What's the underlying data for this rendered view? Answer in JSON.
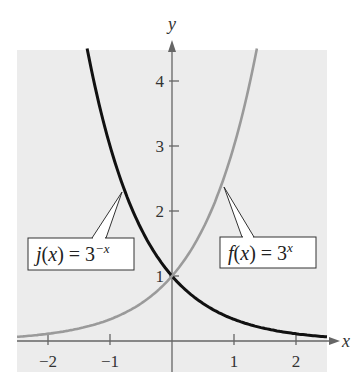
{
  "chart_data": {
    "type": "line",
    "title": "",
    "xlabel": "x",
    "ylabel": "y",
    "xlim": [
      -2.5,
      2.5
    ],
    "ylim": [
      0,
      4.5
    ],
    "grid": false,
    "background": "#ececec",
    "x_ticks": [
      -2,
      -1,
      1,
      2
    ],
    "x_tick_labels": [
      "−2",
      "−1",
      "1",
      "2"
    ],
    "y_ticks": [
      1,
      2,
      3,
      4
    ],
    "y_tick_labels": [
      "1",
      "2",
      "3",
      "4"
    ],
    "series": [
      {
        "name": "j(x) = 3^(-x)",
        "label_text": "j(x) = 3",
        "label_exponent": "−x",
        "color": "#111111",
        "x": [
          -1.37,
          -1.0,
          -0.75,
          -0.5,
          -0.25,
          0,
          0.25,
          0.5,
          1.0,
          1.5,
          2.0,
          2.5
        ],
        "values": [
          4.5,
          3.0,
          2.28,
          1.73,
          1.32,
          1.0,
          0.76,
          0.58,
          0.33,
          0.19,
          0.11,
          0.06
        ]
      },
      {
        "name": "f(x) = 3^x",
        "label_text": "f(x) = 3",
        "label_exponent": "x",
        "color": "#9a9a9a",
        "x": [
          -2.5,
          -2.0,
          -1.5,
          -1.0,
          -0.5,
          -0.25,
          0,
          0.25,
          0.5,
          0.75,
          1.0,
          1.37
        ],
        "values": [
          0.06,
          0.11,
          0.19,
          0.33,
          0.58,
          0.76,
          1.0,
          1.32,
          1.73,
          2.28,
          3.0,
          4.5
        ]
      }
    ],
    "annotations": [
      {
        "text": "j(x) = 3^(-x)",
        "points_to": [
          -0.8,
          2.4
        ]
      },
      {
        "text": "f(x) = 3^x",
        "points_to": [
          0.8,
          2.4
        ]
      }
    ]
  }
}
